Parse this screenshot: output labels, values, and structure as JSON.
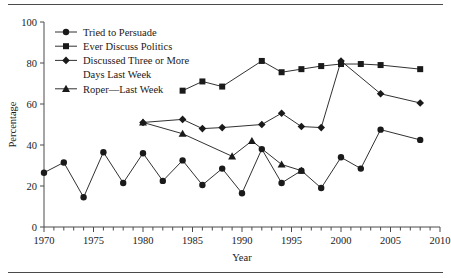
{
  "chart_data": {
    "type": "line",
    "title": "",
    "xlabel": "Year",
    "ylabel": "Percentage",
    "xlim": [
      1970,
      2010
    ],
    "ylim": [
      0,
      100
    ],
    "xticks": [
      1970,
      1975,
      1980,
      1985,
      1990,
      1995,
      2000,
      2005,
      2010
    ],
    "xtick_labels": [
      "1970",
      "1975",
      "1980",
      "1985",
      "1990",
      "1995",
      "2000",
      "2005",
      "2010"
    ],
    "yticks": [
      0,
      20,
      40,
      60,
      80,
      100
    ],
    "ytick_labels": [
      "0",
      "20",
      "40",
      "60",
      "80",
      "100"
    ],
    "minor_xtick_interval": 1,
    "grid": false,
    "legend_position": "upper-left",
    "series": [
      {
        "name": "Tried to Persuade",
        "marker": "circle",
        "color": "#1a1a1a",
        "points": [
          {
            "x": 1970,
            "y": 26.5
          },
          {
            "x": 1972,
            "y": 31.5
          },
          {
            "x": 1974,
            "y": 14.5
          },
          {
            "x": 1976,
            "y": 36.5
          },
          {
            "x": 1978,
            "y": 21.5
          },
          {
            "x": 1980,
            "y": 36.0
          },
          {
            "x": 1982,
            "y": 22.5
          },
          {
            "x": 1984,
            "y": 32.5
          },
          {
            "x": 1986,
            "y": 20.5
          },
          {
            "x": 1988,
            "y": 28.5
          },
          {
            "x": 1990,
            "y": 16.5
          },
          {
            "x": 1992,
            "y": 38.0
          },
          {
            "x": 1994,
            "y": 21.5
          },
          {
            "x": 1996,
            "y": 27.5
          },
          {
            "x": 1998,
            "y": 19.0
          },
          {
            "x": 2000,
            "y": 34.0
          },
          {
            "x": 2002,
            "y": 28.5
          },
          {
            "x": 2004,
            "y": 47.5
          },
          {
            "x": 2008,
            "y": 42.5
          }
        ]
      },
      {
        "name": "Ever Discuss Politics",
        "marker": "square",
        "color": "#1a1a1a",
        "points": [
          {
            "x": 1984,
            "y": 66.5
          },
          {
            "x": 1986,
            "y": 71.0
          },
          {
            "x": 1988,
            "y": 68.5
          },
          {
            "x": 1992,
            "y": 81.0
          },
          {
            "x": 1994,
            "y": 75.5
          },
          {
            "x": 1996,
            "y": 77.0
          },
          {
            "x": 1998,
            "y": 78.5
          },
          {
            "x": 2000,
            "y": 79.5
          },
          {
            "x": 2002,
            "y": 79.5
          },
          {
            "x": 2004,
            "y": 79.0
          },
          {
            "x": 2008,
            "y": 77.0
          }
        ]
      },
      {
        "name": "Discussed Three or More Days Last Week",
        "marker": "diamond",
        "color": "#1a1a1a",
        "points": [
          {
            "x": 1980,
            "y": 51.0
          },
          {
            "x": 1984,
            "y": 52.5
          },
          {
            "x": 1986,
            "y": 48.0
          },
          {
            "x": 1988,
            "y": 48.5
          },
          {
            "x": 1992,
            "y": 50.0
          },
          {
            "x": 1994,
            "y": 55.5
          },
          {
            "x": 1996,
            "y": 49.0
          },
          {
            "x": 1998,
            "y": 48.5
          },
          {
            "x": 2000,
            "y": 81.0
          },
          {
            "x": 2004,
            "y": 65.0
          },
          {
            "x": 2008,
            "y": 60.5
          }
        ]
      },
      {
        "name": "Roper—Last Week",
        "marker": "triangle",
        "color": "#1a1a1a",
        "points": [
          {
            "x": 1980,
            "y": 51.0
          },
          {
            "x": 1984,
            "y": 45.5
          },
          {
            "x": 1989,
            "y": 34.5
          },
          {
            "x": 1991,
            "y": 42.0
          },
          {
            "x": 1994,
            "y": 30.5
          },
          {
            "x": 1996,
            "y": 27.5
          }
        ]
      }
    ]
  },
  "legend": {
    "entries": [
      {
        "label": "Tried to Persuade",
        "marker": "circle"
      },
      {
        "label": "Ever Discuss Politics",
        "marker": "square"
      },
      {
        "label": "Discussed Three or More",
        "label2": "Days Last Week",
        "marker": "diamond"
      },
      {
        "label": "Roper—Last Week",
        "marker": "triangle"
      }
    ]
  }
}
